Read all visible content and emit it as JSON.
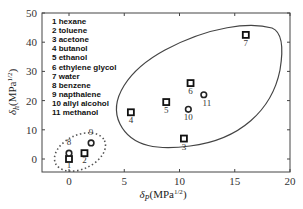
{
  "chart_data": {
    "type": "scatter",
    "title": "",
    "xlabel": "δP(MPa1/2)",
    "ylabel": "δh(MPa1/2)",
    "xlim": [
      -2,
      20
    ],
    "ylim": [
      -4,
      50
    ],
    "xticks": [
      0,
      5,
      10,
      15,
      20
    ],
    "yticks": [
      0,
      10,
      20,
      30,
      40,
      50
    ],
    "grid": false,
    "legend_position": "upper-left",
    "legend": [
      "1 hexane",
      "2 toluene",
      "3 acetone",
      "4 butanol",
      "5 ethanol",
      "6 ethylene glycol",
      "7 water",
      "8 benzene",
      "9 napthalene",
      "10 allyl alcohol",
      "11 methanol"
    ],
    "series": [
      {
        "name": "square markers",
        "marker": "square",
        "points": [
          {
            "id": "1",
            "label": "hexane",
            "x": 0,
            "y": 0
          },
          {
            "id": "2",
            "label": "toluene",
            "x": 1.4,
            "y": 2
          },
          {
            "id": "3",
            "label": "acetone",
            "x": 10.4,
            "y": 7
          },
          {
            "id": "4",
            "label": "butanol",
            "x": 5.6,
            "y": 16
          },
          {
            "id": "5",
            "label": "ethanol",
            "x": 8.8,
            "y": 19.5
          },
          {
            "id": "6",
            "label": "ethylene glycol",
            "x": 11,
            "y": 26
          },
          {
            "id": "7",
            "label": "water",
            "x": 16,
            "y": 42.5
          }
        ]
      },
      {
        "name": "circle markers",
        "marker": "circle",
        "points": [
          {
            "id": "8",
            "label": "benzene",
            "x": 0,
            "y": 2
          },
          {
            "id": "9",
            "label": "napthalene",
            "x": 2,
            "y": 5.5
          },
          {
            "id": "10",
            "label": "allyl alcohol",
            "x": 10.8,
            "y": 17
          },
          {
            "id": "11",
            "label": "methanol",
            "x": 12.2,
            "y": 22
          }
        ]
      }
    ],
    "annotations": [
      {
        "type": "dotted-ellipse",
        "encloses": [
          "1",
          "2",
          "8",
          "9"
        ]
      },
      {
        "type": "solid-ellipse",
        "encloses": [
          "3",
          "4",
          "5",
          "6",
          "7",
          "10",
          "11"
        ]
      }
    ]
  },
  "axes": {
    "x_title_main": "δ",
    "x_title_sub": "P",
    "x_title_unit": "(MPa",
    "x_title_sup": "1/2",
    "x_title_close": ")",
    "y_title_main": "δ",
    "y_title_sub": "h",
    "y_title_unit": "(MPa",
    "y_title_sup": "1/2",
    "y_title_close": ")"
  }
}
